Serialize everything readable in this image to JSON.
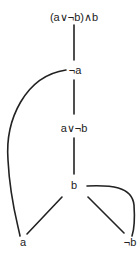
{
  "diagram": {
    "type": "proof-tree",
    "nodes": [
      {
        "id": "root",
        "label": "(a∨¬b)∧b",
        "x": 74,
        "y": 17
      },
      {
        "id": "not-a",
        "label": "¬a",
        "x": 75,
        "y": 70
      },
      {
        "id": "a-or-not-b",
        "label": "a∨¬b",
        "x": 74,
        "y": 128
      },
      {
        "id": "b",
        "label": "b",
        "x": 74,
        "y": 185
      },
      {
        "id": "a",
        "label": "a",
        "x": 23,
        "y": 242
      },
      {
        "id": "not-b",
        "label": "¬b",
        "x": 130,
        "y": 242
      }
    ],
    "edges": [
      {
        "from": "root",
        "to": "not-a"
      },
      {
        "from": "not-a",
        "to": "a-or-not-b"
      },
      {
        "from": "a-or-not-b",
        "to": "b"
      },
      {
        "from": "b",
        "to": "a"
      },
      {
        "from": "b",
        "to": "not-b"
      },
      {
        "from": "not-a",
        "to": "a",
        "curved": true
      },
      {
        "from": "b",
        "to": "not-b",
        "curved": true
      }
    ],
    "line_color": "#222222"
  }
}
